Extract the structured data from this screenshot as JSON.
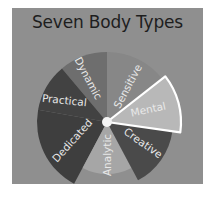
{
  "title": "Seven Body Types",
  "colors": {
    "panel": "#8f8f8f",
    "title": "#1e1e1e",
    "label": "#e8e8e8",
    "highlight_border": "#ffffff"
  },
  "wheel": {
    "center": [
      107,
      122
    ],
    "segments": [
      {
        "label": "Mental",
        "color": "#b8b8b8",
        "highlighted": true
      },
      {
        "label": "Creative",
        "color": "#4a4a4a",
        "highlighted": false
      },
      {
        "label": "Analytic",
        "color": "#a6a6a6",
        "highlighted": false
      },
      {
        "label": "Dedicated",
        "color": "#3e3e3e",
        "highlighted": false
      },
      {
        "label": "Practical",
        "color": "#424242",
        "highlighted": false
      },
      {
        "label": "Dynamic",
        "color": "#6e6e6e",
        "highlighted": false
      },
      {
        "label": "Sensitive",
        "color": "#878787",
        "highlighted": false
      }
    ]
  }
}
